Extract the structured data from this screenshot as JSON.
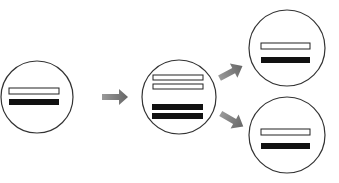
{
  "diagram": {
    "type": "replication-flow",
    "colors": {
      "outline": "#333333",
      "filled_strand": "#111111",
      "open_strand": "#ffffff",
      "arrow": "#777777",
      "background": "#ffffff"
    },
    "nodes": [
      {
        "id": "parent",
        "strands": [
          "open",
          "filled"
        ]
      },
      {
        "id": "replicating",
        "strands": [
          "open",
          "open",
          "filled",
          "filled"
        ]
      },
      {
        "id": "daughter-top",
        "strands": [
          "open",
          "filled"
        ]
      },
      {
        "id": "daughter-bottom",
        "strands": [
          "open",
          "filled"
        ]
      }
    ],
    "edges": [
      {
        "from": "parent",
        "to": "replicating"
      },
      {
        "from": "replicating",
        "to": "daughter-top"
      },
      {
        "from": "replicating",
        "to": "daughter-bottom"
      }
    ]
  }
}
